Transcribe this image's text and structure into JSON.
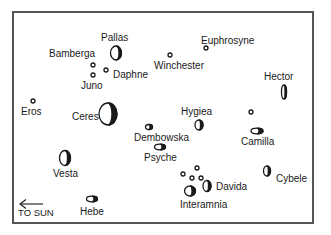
{
  "diagram": {
    "direction_label": "TO SUN",
    "direction_arrow": "left-arrow",
    "colors": {
      "ink": "#1a1a1a",
      "frame": "#555555",
      "background": "#ffffff"
    },
    "asteroids": [
      {
        "name": "Pallas",
        "shape": "large-crescent"
      },
      {
        "name": "Euphrosyne",
        "shape": "small-dot"
      },
      {
        "name": "Bamberga",
        "shape": "small-dot"
      },
      {
        "name": "Winchester",
        "shape": "small-dot"
      },
      {
        "name": "Daphne",
        "shape": "small-dot"
      },
      {
        "name": "Juno",
        "shape": "small-dot"
      },
      {
        "name": "Hector",
        "shape": "elongated-ellipse"
      },
      {
        "name": "Eros",
        "shape": "small-dot"
      },
      {
        "name": "Ceres",
        "shape": "large-crescent"
      },
      {
        "name": "Hygiea",
        "shape": "medium-crescent"
      },
      {
        "name": "Dembowska",
        "shape": "small-ellipse"
      },
      {
        "name": "Camilla",
        "shape": "horizontal-ellipse"
      },
      {
        "name": "Psyche",
        "shape": "horizontal-ellipse"
      },
      {
        "name": "Vesta",
        "shape": "medium-crescent"
      },
      {
        "name": "Cybele",
        "shape": "medium-crescent"
      },
      {
        "name": "Davida",
        "shape": "medium-crescent"
      },
      {
        "name": "Interamnia",
        "shape": "medium-crescent"
      },
      {
        "name": "Hebe",
        "shape": "horizontal-ellipse"
      }
    ]
  }
}
